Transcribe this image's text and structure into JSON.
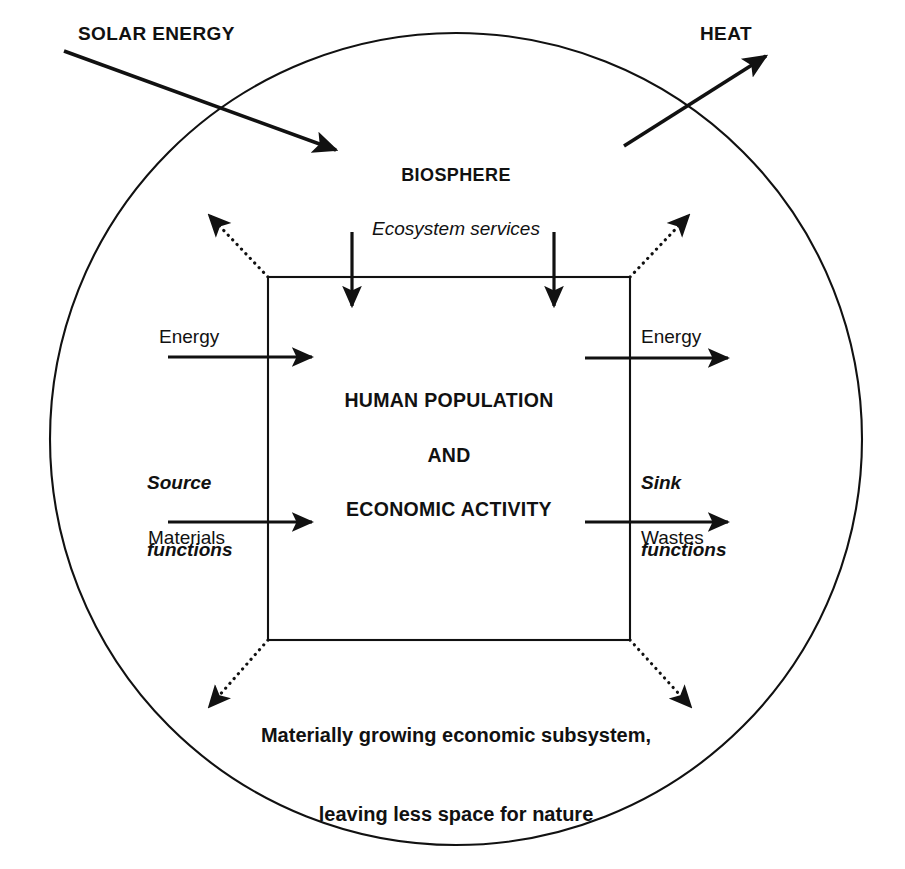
{
  "diagram": {
    "outer_system": {
      "label": "BIOSPHERE",
      "shape": "circle",
      "center_x": 456,
      "center_y": 439,
      "radius": 406
    },
    "inner_system": {
      "lines": [
        "HUMAN POPULATION",
        "AND",
        "ECONOMIC ACTIVITY"
      ],
      "shape": "rectangle",
      "left": 268,
      "top": 277,
      "right": 630,
      "bottom": 640
    },
    "energy_flows": {
      "solar_input_label": "SOLAR ENERGY",
      "heat_output_label": "HEAT"
    },
    "ecosystem_services_label": "Ecosystem services",
    "left_side": {
      "group_label_line1": "Source",
      "group_label_line2": "functions",
      "inflow_top": "Energy",
      "inflow_bottom": "Materials"
    },
    "right_side": {
      "group_label_line1": "Sink",
      "group_label_line2": "functions",
      "outflow_top": "Energy",
      "outflow_bottom": "Wastes"
    },
    "caption": {
      "line1": "Materially growing economic subsystem,",
      "line2": "leaving less space for nature"
    },
    "colors": {
      "stroke": "#111111",
      "text": "#111111",
      "background": "#ffffff"
    },
    "icons": {
      "solar_arrow": "arrow-down-right-icon",
      "heat_arrow": "arrow-up-right-icon",
      "service_arrow": "arrow-down-icon",
      "flow_arrow": "arrow-right-icon",
      "growth_arrow": "dotted-arrow-diagonal-icon"
    }
  }
}
